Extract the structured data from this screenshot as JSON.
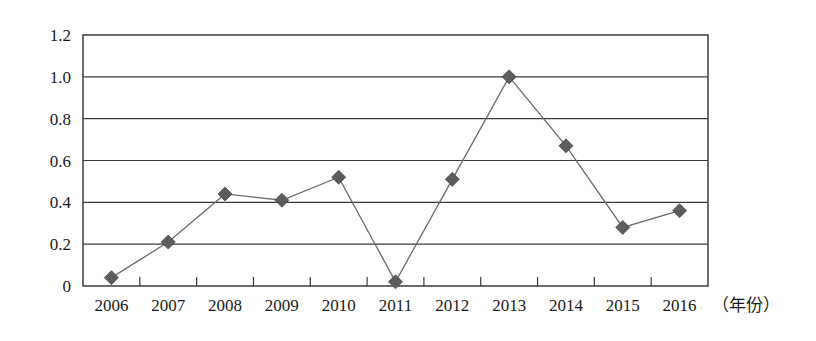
{
  "chart_data": {
    "type": "line",
    "title": "",
    "xlabel": "（年份）",
    "ylabel": "",
    "categories": [
      "2006",
      "2007",
      "2008",
      "2009",
      "2010",
      "2011",
      "2012",
      "2013",
      "2014",
      "2015",
      "2016"
    ],
    "values": [
      0.04,
      0.21,
      0.44,
      0.41,
      0.52,
      0.02,
      0.51,
      1.0,
      0.67,
      0.28,
      0.36
    ],
    "series": [
      {
        "name": "",
        "values": [
          0.04,
          0.21,
          0.44,
          0.41,
          0.52,
          0.02,
          0.51,
          1.0,
          0.67,
          0.28,
          0.36
        ]
      }
    ],
    "ylim": [
      0,
      1.2
    ],
    "yticks": [
      0,
      0.2,
      0.4,
      0.6,
      0.8,
      1.0,
      1.2
    ],
    "ytick_labels": [
      "0",
      "0.2",
      "0.4",
      "0.6",
      "0.8",
      "1.0",
      "1.2"
    ],
    "grid": true,
    "grid_axis": "y",
    "legend": "none",
    "marker": "diamond",
    "marker_color": "#5c5c5c",
    "line_color": "#6b6b6b",
    "axis_color": "#2e2e2e",
    "background": "#ffffff"
  },
  "axis_label_text": "（年份）"
}
